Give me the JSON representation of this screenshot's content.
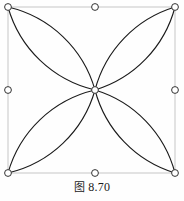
{
  "figure": {
    "caption_label": "图",
    "caption_number": "8.70",
    "caption_full": "图 8.70",
    "background_color": "#fefefe",
    "stroke_color": "#1a1a1a",
    "stroke_width": 1.1
  },
  "selection": {
    "box": {
      "x": 8,
      "y": 7,
      "width": 167,
      "height": 166,
      "border_color": "#b9b9b9",
      "border_width": 0.8
    },
    "handle_style": {
      "radius": 3.4,
      "fill": "#ffffff",
      "stroke": "#333333",
      "stroke_width": 1.0
    },
    "handles": [
      {
        "name": "handle-top-left",
        "cx": 8,
        "cy": 7
      },
      {
        "name": "handle-top-center",
        "cx": 95,
        "cy": 7
      },
      {
        "name": "handle-top-right",
        "cx": 175,
        "cy": 7
      },
      {
        "name": "handle-middle-left",
        "cx": 8,
        "cy": 90
      },
      {
        "name": "handle-center",
        "cx": 95,
        "cy": 90
      },
      {
        "name": "handle-middle-right",
        "cx": 175,
        "cy": 90
      },
      {
        "name": "handle-bottom-left",
        "cx": 8,
        "cy": 173
      },
      {
        "name": "handle-bottom-center",
        "cx": 95,
        "cy": 173
      },
      {
        "name": "handle-bottom-right",
        "cx": 175,
        "cy": 173
      }
    ]
  },
  "petals": [
    {
      "name": "petal-top-left",
      "path": "M 8 7 A 118 118 0 0 1 95 90 A 118 118 0 0 1 8 7 Z"
    },
    {
      "name": "petal-top-right",
      "path": "M 175 7 A 118 118 0 0 0 95 90 A 118 118 0 0 0 175 7 Z"
    },
    {
      "name": "petal-bottom-left",
      "path": "M 8 173 A 118 118 0 0 0 95 90 A 118 118 0 0 0 8 173 Z"
    },
    {
      "name": "petal-bottom-right",
      "path": "M 175 173 A 118 118 0 0 1 95 90 A 118 118 0 0 1 175 173 Z"
    }
  ]
}
